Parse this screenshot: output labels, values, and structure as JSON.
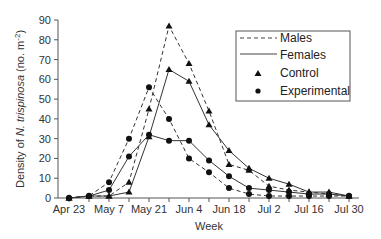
{
  "chart_data": {
    "type": "line",
    "title": "",
    "xlabel": "Week",
    "ylabel": "Density of N. trispinosa (no. m-2)",
    "ylabel_parts": {
      "pre": "Density of ",
      "italic": "N. trispinosa",
      "post": " (no. m",
      "sup": "-2",
      "end": ")"
    },
    "ylim": [
      0,
      90
    ],
    "yticks": [
      0,
      10,
      20,
      30,
      40,
      50,
      60,
      70,
      80,
      90
    ],
    "x_tick_labels": [
      "Apr 23",
      "May 7",
      "May 21",
      "Jun 4",
      "Jun 18",
      "Jul 2",
      "Jul 16",
      "Jul 30"
    ],
    "x": [
      "Apr 23",
      "Apr 30",
      "May 7",
      "May 14",
      "May 21",
      "May 28",
      "Jun 4",
      "Jun 11",
      "Jun 18",
      "Jun 25",
      "Jul 2",
      "Jul 9",
      "Jul 16",
      "Jul 23",
      "Jul 30"
    ],
    "series": [
      {
        "name": "Males - Control",
        "line": "dashed",
        "marker": "triangle",
        "values": [
          0,
          1,
          1,
          8,
          45,
          87,
          68,
          44,
          17,
          14,
          6,
          4,
          3,
          2,
          1
        ]
      },
      {
        "name": "Females - Control",
        "line": "solid",
        "marker": "triangle",
        "values": [
          0,
          1,
          1,
          3,
          31,
          65,
          59,
          37,
          24,
          15,
          10,
          7,
          3,
          3,
          1
        ]
      },
      {
        "name": "Males - Experimental",
        "line": "dashed",
        "marker": "circle",
        "values": [
          0,
          1,
          8,
          30,
          56,
          40,
          20,
          13,
          5,
          2,
          1,
          1,
          1,
          1,
          1
        ]
      },
      {
        "name": "Females - Experimental",
        "line": "solid",
        "marker": "circle",
        "values": [
          0,
          1,
          4,
          21,
          32,
          29,
          29,
          19,
          11,
          5,
          4,
          3,
          2,
          2,
          1
        ]
      }
    ],
    "legend": {
      "position": "upper right",
      "entries": [
        {
          "label": "Males",
          "symbol": "dashed-line"
        },
        {
          "label": "Females",
          "symbol": "solid-line"
        },
        {
          "label": "Control",
          "symbol": "triangle"
        },
        {
          "label": "Experimental",
          "symbol": "circle"
        }
      ]
    },
    "grid": false
  }
}
